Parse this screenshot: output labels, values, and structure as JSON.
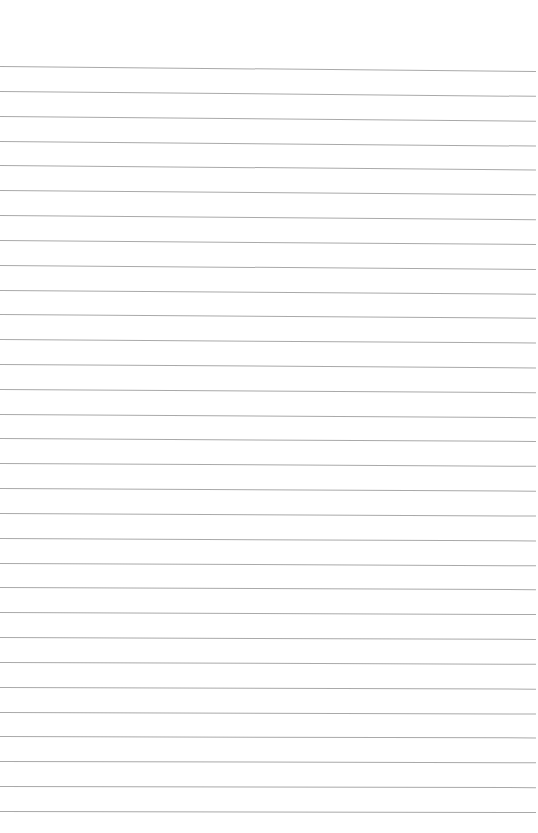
{
  "page": {
    "type": "lined-paper",
    "background_color": "#ffffff",
    "line_color": "#a9a9a9",
    "line_count": 31,
    "first_line_y": 66,
    "line_spacing": 24.83,
    "line_left": 0,
    "line_right": 536,
    "tilt_top_px": 5,
    "tilt_bottom_px": 1,
    "text": ""
  }
}
